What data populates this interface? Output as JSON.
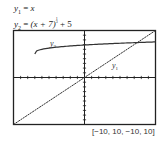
{
  "equations": {
    "eq1": {
      "lhs": "y",
      "sub": "1",
      "eq": " = ",
      "rhs": "x"
    },
    "eq2": {
      "lhs": "y",
      "sub": "2",
      "eq": " = ",
      "rhs_a": "(x + 7)",
      "exp_num": "1",
      "exp_den": "3",
      "rhs_b": " + 5"
    }
  },
  "window_label": "[−10, 10, −10, 10]",
  "curve_labels": {
    "y1": "y",
    "y1_sub": "1",
    "y2": "y",
    "y2_sub": "2"
  },
  "chart_data": {
    "type": "line",
    "title": "",
    "xlabel": "",
    "ylabel": "",
    "xlim": [
      -10,
      10
    ],
    "ylim": [
      -10,
      10
    ],
    "xscale": 1,
    "yscale": 1,
    "grid": false,
    "series": [
      {
        "name": "y1",
        "formula": "x",
        "x": [
          -10,
          -5,
          0,
          5,
          10
        ],
        "y": [
          -10,
          -5,
          0,
          5,
          10
        ]
      },
      {
        "name": "y2",
        "formula": "(x+7)^(1/3)+5",
        "x": [
          -7,
          -6,
          -3,
          0,
          3,
          6,
          10
        ],
        "y": [
          5,
          6,
          6.59,
          6.91,
          7.15,
          7.35,
          7.57
        ]
      }
    ],
    "annotations": [
      "y1",
      "y2",
      "[-10, 10, -10, 10]"
    ]
  }
}
